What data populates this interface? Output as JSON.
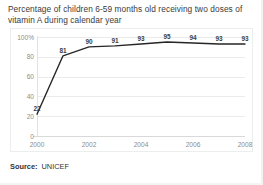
{
  "chart_data": {
    "type": "line",
    "title": "Percentage of children 6-59 months old receiving two doses of vitamin A during calendar year",
    "xlabel": "",
    "ylabel": "",
    "x": [
      2000,
      2001,
      2002,
      2003,
      2004,
      2005,
      2006,
      2007,
      2008
    ],
    "values": [
      22,
      81,
      90,
      91,
      93,
      95,
      94,
      93,
      93
    ],
    "point_labels": [
      "22",
      "81",
      "90",
      "91",
      "93",
      "95",
      "94",
      "93",
      "93"
    ],
    "xlim": [
      2000,
      2008
    ],
    "ylim": [
      0,
      100
    ],
    "y_ticks": [
      0,
      20,
      40,
      60,
      80,
      100
    ],
    "y_tick_labels": [
      "0",
      "20",
      "40",
      "60",
      "80",
      "100%"
    ],
    "x_ticks": [
      2000,
      2002,
      2004,
      2006,
      2008
    ],
    "x_tick_labels": [
      "2000",
      "2002",
      "2004",
      "2006",
      "2008"
    ],
    "grid": "horizontal",
    "legend": "none",
    "line_color": "#262626",
    "line_width": 1.4
  },
  "source": {
    "label": "Source:",
    "value": "UNICEF"
  },
  "colors": {
    "background": "#ffffff",
    "grid": "#ebebeb",
    "axis": "#d9d9d9",
    "title_text": "#3a3a3a",
    "tick_text": "#8d8d8d",
    "label_text": "#3c3c3c"
  }
}
